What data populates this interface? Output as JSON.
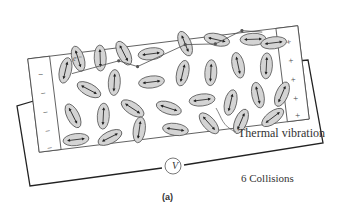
{
  "figure": {
    "panel_label": "(a)",
    "caption_counter": "6 Collisions",
    "annotation": "Thermal vibration",
    "meter_symbol": "V",
    "electron_symbol": "e⁻",
    "left_plate_signs": [
      "−",
      "−",
      "−",
      "−",
      "−"
    ],
    "right_plate_signs": [
      "+",
      "+",
      "+",
      "+",
      "+"
    ],
    "colors": {
      "ion_fill": "#d4d4d4",
      "ion_stroke": "#555555",
      "line": "#333333",
      "background": "#ffffff"
    }
  }
}
